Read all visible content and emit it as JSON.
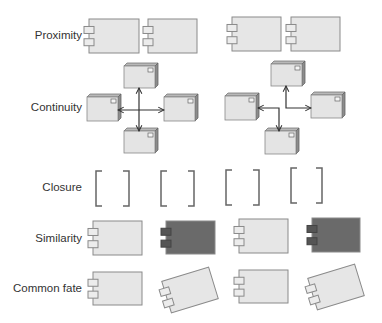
{
  "colors": {
    "component_fill": "#e6e6e6",
    "component_stroke": "#8a8a8a",
    "component_dark_fill": "#6a6a6a",
    "component_dark_port": "#555555",
    "node_front": "#e4e4e4",
    "node_top": "#b8b8b8",
    "node_side": "#8c8c8c",
    "line": "#333333",
    "bracket": "#666666",
    "label_text": "#333333"
  },
  "rows": [
    {
      "id": "proximity",
      "label": "Proximity",
      "y": 36
    },
    {
      "id": "continuity",
      "label": "Continuity",
      "y": 108
    },
    {
      "id": "closure",
      "label": "Closure",
      "y": 188
    },
    {
      "id": "similarity",
      "label": "Similarity",
      "y": 239
    },
    {
      "id": "common-fate",
      "label": "Common fate",
      "y": 289
    }
  ],
  "proximity": {
    "components": [
      {
        "x": 89,
        "y": 19,
        "w": 50,
        "h": 34
      },
      {
        "x": 148,
        "y": 19,
        "w": 49,
        "h": 34
      },
      {
        "x": 232,
        "y": 17,
        "w": 49,
        "h": 34
      },
      {
        "x": 291,
        "y": 17,
        "w": 49,
        "h": 34
      }
    ]
  },
  "continuity": {
    "left_group": {
      "nodes": [
        {
          "x": 124,
          "y": 66,
          "w": 31,
          "h": 22
        },
        {
          "x": 87,
          "y": 97,
          "w": 31,
          "h": 24
        },
        {
          "x": 164,
          "y": 97,
          "w": 31,
          "h": 24
        },
        {
          "x": 124,
          "y": 131,
          "w": 31,
          "h": 22
        }
      ],
      "lines": [
        {
          "x1": 139,
          "y1": 88,
          "x2": 139,
          "y2": 131,
          "arrows": "both"
        },
        {
          "x1": 118,
          "y1": 110,
          "x2": 164,
          "y2": 110,
          "arrows": "both"
        }
      ]
    },
    "right_group": {
      "nodes": [
        {
          "x": 271,
          "y": 64,
          "w": 31,
          "h": 22
        },
        {
          "x": 225,
          "y": 96,
          "w": 31,
          "h": 24
        },
        {
          "x": 311,
          "y": 95,
          "w": 31,
          "h": 23
        },
        {
          "x": 265,
          "y": 131,
          "w": 31,
          "h": 23
        }
      ],
      "polylines": [
        {
          "points": "258,108 279,108 279,131",
          "start_arrow": true,
          "end_arrow": true
        },
        {
          "points": "286,86 286,108 311,108",
          "start_arrow": true,
          "end_arrow": true
        }
      ]
    }
  },
  "closure": {
    "pairs": [
      {
        "x": 96,
        "y": 171,
        "w": 33,
        "h": 35
      },
      {
        "x": 161,
        "y": 171,
        "w": 33,
        "h": 35
      },
      {
        "x": 226,
        "y": 170,
        "w": 33,
        "h": 35
      },
      {
        "x": 291,
        "y": 168,
        "w": 31,
        "h": 35
      }
    ]
  },
  "similarity": {
    "components": [
      {
        "x": 93,
        "y": 221,
        "w": 49,
        "h": 34,
        "dark": false
      },
      {
        "x": 166,
        "y": 221,
        "w": 49,
        "h": 33,
        "dark": true
      },
      {
        "x": 239,
        "y": 219,
        "w": 49,
        "h": 34,
        "dark": false
      },
      {
        "x": 312,
        "y": 218,
        "w": 48,
        "h": 34,
        "dark": true
      }
    ]
  },
  "common_fate": {
    "components": [
      {
        "x": 93,
        "y": 272,
        "w": 49,
        "h": 33,
        "rotate": 0
      },
      {
        "cx": 190,
        "cy": 290,
        "w": 49,
        "h": 33,
        "rotate": -17
      },
      {
        "x": 239,
        "y": 270,
        "w": 49,
        "h": 33,
        "rotate": 0
      },
      {
        "cx": 336,
        "cy": 287,
        "w": 49,
        "h": 33,
        "rotate": -17
      }
    ]
  }
}
